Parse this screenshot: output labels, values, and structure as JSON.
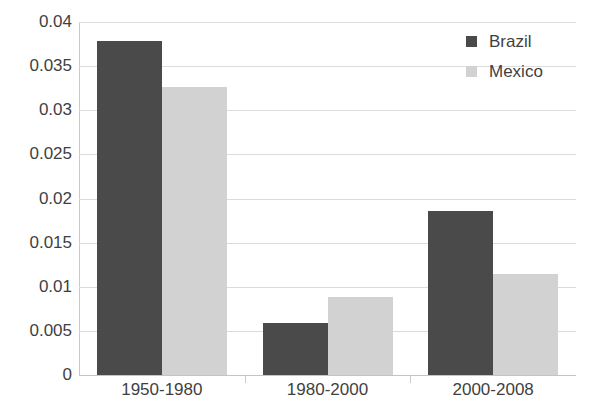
{
  "chart_data": {
    "type": "bar",
    "title": "",
    "xlabel": "",
    "ylabel": "",
    "categories": [
      "1950-1980",
      "1980-2000",
      "2000-2008"
    ],
    "series": [
      {
        "name": "Brazil",
        "color": "#4a4a4a",
        "values": [
          0.0378,
          0.0059,
          0.0186
        ]
      },
      {
        "name": "Mexico",
        "color": "#d2d2d2",
        "values": [
          0.0326,
          0.0088,
          0.0114
        ]
      }
    ],
    "ylim": [
      0,
      0.04
    ],
    "ytick_labels": [
      "0.04",
      "0.035",
      "0.03",
      "0.025",
      "0.02",
      "0.015",
      "0.01",
      "0.005",
      "0"
    ],
    "ytick_values": [
      0.04,
      0.035,
      0.03,
      0.025,
      0.02,
      0.015,
      0.01,
      0.005,
      0
    ],
    "grid": true,
    "legend_position": "top-right"
  },
  "legend": {
    "items": [
      {
        "label": "Brazil",
        "color": "#4a4a4a"
      },
      {
        "label": "Mexico",
        "color": "#d2d2d2"
      }
    ]
  }
}
